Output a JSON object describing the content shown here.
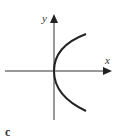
{
  "figure": {
    "x_label": "x",
    "y_label": "y",
    "caption": "c",
    "curve": "left-opening parabola branch (x = y^2), vertex at origin",
    "colors": {
      "axis": "#333333",
      "curve": "#222222"
    }
  }
}
